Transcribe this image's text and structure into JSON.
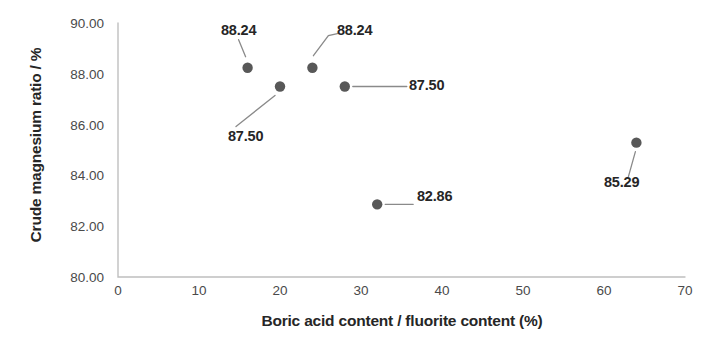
{
  "chart_data": {
    "type": "scatter",
    "title": "",
    "xlabel": "Boric acid content / fluorite content  (%)",
    "ylabel": "Crude magnesium ratio / %",
    "xlim": [
      0,
      70
    ],
    "ylim": [
      80.0,
      90.0
    ],
    "xticks": [
      "0",
      "10",
      "20",
      "30",
      "40",
      "50",
      "60",
      "70"
    ],
    "xtick_values": [
      0,
      10,
      20,
      30,
      40,
      50,
      60,
      70
    ],
    "yticks": [
      "80.00",
      "82.00",
      "84.00",
      "86.00",
      "88.00",
      "90.00"
    ],
    "ytick_values": [
      80.0,
      82.0,
      84.0,
      86.0,
      88.0,
      90.0
    ],
    "grid": false,
    "legend": false,
    "marker_color": "#585858",
    "axis_color": "#bfbfbf",
    "points": [
      {
        "x": 16,
        "y": 88.24,
        "label": "88.24",
        "label_pos": "above-left"
      },
      {
        "x": 20,
        "y": 87.5,
        "label": "87.50",
        "label_pos": "below-left"
      },
      {
        "x": 24,
        "y": 88.24,
        "label": "88.24",
        "label_pos": "above-right"
      },
      {
        "x": 28,
        "y": 87.5,
        "label": "87.50",
        "label_pos": "right"
      },
      {
        "x": 32,
        "y": 82.86,
        "label": "82.86",
        "label_pos": "right"
      },
      {
        "x": 64,
        "y": 85.29,
        "label": "85.29",
        "label_pos": "below-left"
      }
    ]
  }
}
